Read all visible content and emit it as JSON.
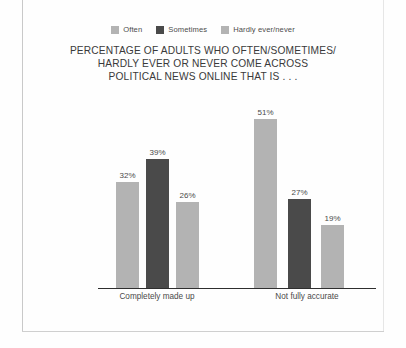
{
  "page": {
    "background_color": "#fefefe",
    "rule_color": "#c9c9c9"
  },
  "legend": {
    "position": "top-center",
    "items": [
      {
        "label": "Often",
        "color": "#b3b3b3",
        "swatch_name": "often-swatch"
      },
      {
        "label": "Sometimes",
        "color": "#4a4a4a",
        "swatch_name": "sometimes-swatch"
      },
      {
        "label": "Hardly ever/never",
        "color": "#b3b3b3",
        "swatch_name": "hardly-ever-never-swatch"
      }
    ]
  },
  "title": {
    "line1": "PERCENTAGE OF ADULTS WHO OFTEN/SOMETIMES/",
    "line2": "HARDLY EVER OR NEVER COME ACROSS",
    "line3": "POLITICAL NEWS ONLINE THAT IS . . ."
  },
  "chart_data": {
    "type": "bar",
    "title": "PERCENTAGE OF ADULTS WHO OFTEN/SOMETIMES/ HARDLY EVER OR NEVER COME ACROSS POLITICAL NEWS ONLINE THAT IS . . .",
    "xlabel": "",
    "ylabel": "",
    "ylim": [
      0,
      60
    ],
    "grid": false,
    "legend_position": "top-center",
    "value_labels_suffix": "%",
    "categories": [
      "Completely made up",
      "Not fully accurate"
    ],
    "series": [
      {
        "name": "Often",
        "color": "#b3b3b3",
        "values": [
          32,
          51
        ],
        "labels": [
          "32%",
          "51%"
        ]
      },
      {
        "name": "Sometimes",
        "color": "#4a4a4a",
        "values": [
          39,
          27
        ],
        "labels": [
          "39%",
          "27%"
        ]
      },
      {
        "name": "Hardly ever/never",
        "color": "#b3b3b3",
        "values": [
          26,
          19
        ],
        "labels": [
          "26%",
          "19%"
        ]
      }
    ]
  },
  "bars": [
    {
      "name": "bar-made-up-often",
      "series": "Often",
      "category": "Completely made up",
      "value": 32,
      "label": "32%",
      "color": "#b3b3b3",
      "left": 116,
      "width": 23
    },
    {
      "name": "bar-made-up-sometimes",
      "series": "Sometimes",
      "category": "Completely made up",
      "value": 39,
      "label": "39%",
      "color": "#4a4a4a",
      "left": 146,
      "width": 23
    },
    {
      "name": "bar-made-up-hardly",
      "series": "Hardly ever/never",
      "category": "Completely made up",
      "value": 26,
      "label": "26%",
      "color": "#b3b3b3",
      "left": 176,
      "width": 23
    },
    {
      "name": "bar-not-accurate-often",
      "series": "Often",
      "category": "Not fully accurate",
      "value": 51,
      "label": "51%",
      "color": "#b3b3b3",
      "left": 254,
      "width": 23
    },
    {
      "name": "bar-not-accurate-sometimes",
      "series": "Sometimes",
      "category": "Not fully accurate",
      "value": 27,
      "label": "27%",
      "color": "#4a4a4a",
      "left": 288,
      "width": 23
    },
    {
      "name": "bar-not-accurate-hardly",
      "series": "Hardly ever/never",
      "category": "Not fully accurate",
      "value": 19,
      "label": "19%",
      "color": "#b3b3b3",
      "left": 321,
      "width": 23
    }
  ],
  "category_labels": [
    {
      "text": "Completely made up",
      "left": 98,
      "width": 118
    },
    {
      "text": "Not fully accurate",
      "left": 238,
      "width": 138
    }
  ],
  "axis": {
    "line_color": "#2e2e2e",
    "baseline_y": 288,
    "px_per_percent": 3.31
  }
}
